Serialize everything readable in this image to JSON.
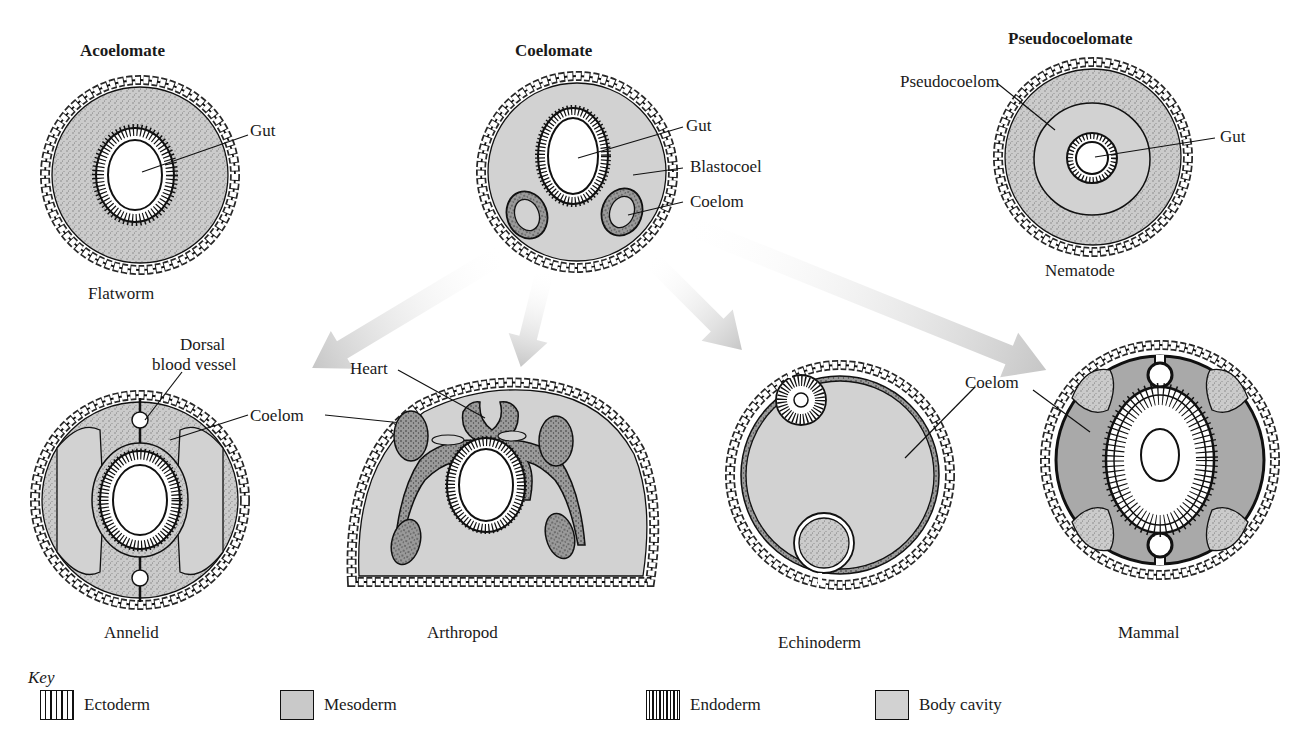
{
  "headers": {
    "acoelomate": "Acoelomate",
    "coelomate": "Coelomate",
    "pseudocoelomate": "Pseudocoelomate"
  },
  "organisms": {
    "flatworm": "Flatworm",
    "nematode": "Nematode",
    "annelid": "Annelid",
    "arthropod": "Arthropod",
    "echinoderm": "Echinoderm",
    "mammal": "Mammal"
  },
  "callouts": {
    "acoelomate_gut": "Gut",
    "coelomate_gut": "Gut",
    "coelomate_blastocoel": "Blastocoel",
    "coelomate_coelom": "Coelom",
    "pseudo_pseudocoelom": "Pseudocoelom",
    "pseudo_gut": "Gut",
    "annelid_dorsal_line1": "Dorsal",
    "annelid_dorsal_line2": "blood vessel",
    "shared_coelom": "Coelom",
    "arthropod_heart": "Heart",
    "echinoderm_coelom": "Coelom"
  },
  "key": {
    "title": "Key",
    "items": [
      {
        "label": "Ectoderm",
        "pattern": "vertical-stripes"
      },
      {
        "label": "Mesoderm",
        "pattern": "stipple"
      },
      {
        "label": "Endoderm",
        "pattern": "dense-stripes"
      },
      {
        "label": "Body cavity",
        "pattern": "light-gray"
      }
    ]
  },
  "colors": {
    "body_cavity": "#d2d2d2",
    "mesoderm": "#c4c4c4",
    "coelom_dark": "#a9a9a9",
    "line": "#111111",
    "arrow": "#cfcfcf"
  }
}
